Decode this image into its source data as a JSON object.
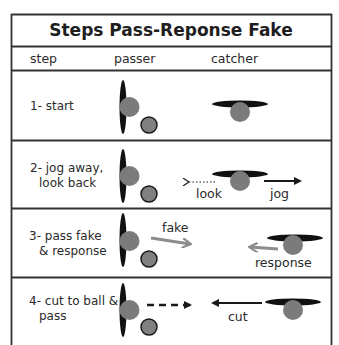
{
  "title": "Steps Pass-Reponse Fake",
  "columns": [
    "step",
    "passer",
    "catcher"
  ],
  "colors": {
    "border": "#333333",
    "player": "#7b7b7b",
    "disc": "#808080",
    "body": "#111111",
    "black_arrow": "#1a1a1a",
    "gray_arrow": "#8c8c8c"
  },
  "rows": [
    {
      "step_lines": [
        "1- start"
      ],
      "labels": []
    },
    {
      "step_lines": [
        "2- jog away,",
        "look back"
      ],
      "labels": [
        "look",
        "jog"
      ],
      "arrows": [
        {
          "name": "look-arrow",
          "style": "dotted",
          "direction": "left",
          "color": "black"
        },
        {
          "name": "jog-arrow",
          "style": "solid",
          "direction": "right",
          "color": "black"
        }
      ]
    },
    {
      "step_lines": [
        "3- pass fake",
        "& response"
      ],
      "labels": [
        "fake",
        "response"
      ],
      "arrows": [
        {
          "name": "fake-arrow",
          "style": "solid",
          "direction": "right",
          "color": "gray"
        },
        {
          "name": "response-arrow",
          "style": "solid",
          "direction": "left",
          "color": "gray"
        }
      ]
    },
    {
      "step_lines": [
        "4- cut to ball &",
        "pass"
      ],
      "labels": [
        "cut"
      ],
      "arrows": [
        {
          "name": "pass-arrow",
          "style": "dashed",
          "direction": "right",
          "color": "black"
        },
        {
          "name": "cut-arrow",
          "style": "solid",
          "direction": "left",
          "color": "black"
        }
      ]
    }
  ]
}
